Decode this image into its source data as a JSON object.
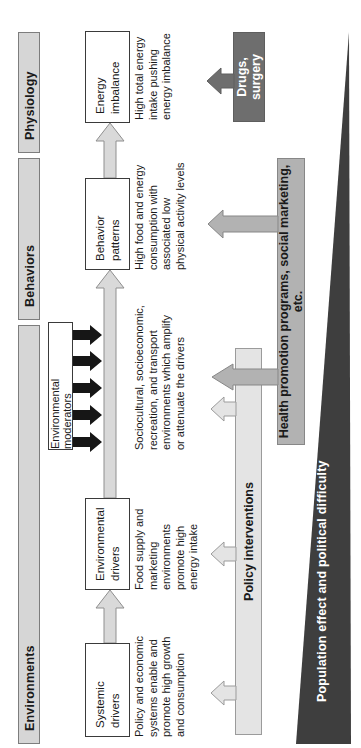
{
  "figure": {
    "headers": {
      "environments": "Environments",
      "behaviors": "Behaviors",
      "physiology": "Physiology"
    },
    "chain": [
      {
        "label": "Systemic\ndrivers",
        "desc": "Policy and economic\nsystems enable and\npromote high growth\nand consumption"
      },
      {
        "label": "Environmental\ndrivers",
        "desc": "Food supply and\nmarketing\nenvironments\npromote high\nenergy intake"
      },
      {
        "label": "Behavior\npatterns",
        "desc": "High food and energy\nconsumption with\nassociated low\nphysical activity levels"
      },
      {
        "label": "Energy\nimbalance",
        "desc": "High total energy\nintake pushing\nenergy imbalance"
      }
    ],
    "moderators": {
      "label": "Environmental moderators",
      "desc": "Sociocultural, socioeconomic,\nrecreation, and transport\nenvironments which amplify\nor attenuate the drivers"
    },
    "interventions": {
      "policy": "Policy interventions",
      "health": "Health promotion programs, social marketing, etc.",
      "drugs": "Drugs, surgery"
    },
    "wedge_label": "Population effect and political difficulty",
    "colors": {
      "header_fill": "#d6d6d6",
      "box_border": "#3a3a3a",
      "chain_arrow_fill": "#d9d9d9",
      "moderator_arrow": "#161616",
      "policy_fill": "#e4e4e4",
      "health_fill": "#b2b2b2",
      "drugs_fill": "#6e6e6e",
      "wedge_fill": "#3e3e3e"
    }
  }
}
